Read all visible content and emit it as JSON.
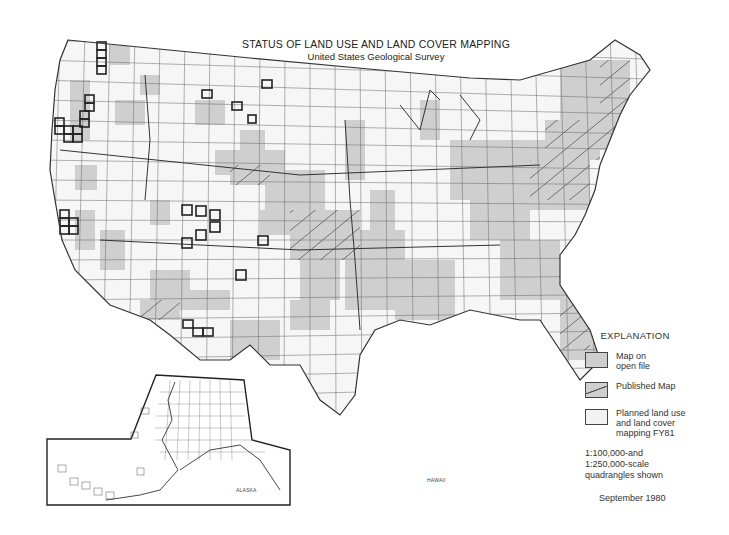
{
  "header": {
    "title": "STATUS OF LAND USE AND LAND COVER MAPPING",
    "subtitle": "United States Geological Survey"
  },
  "legend": {
    "heading": "EXPLANATION",
    "items": [
      {
        "key": "open",
        "label": "Map on\nopen file",
        "color": "#cfcfcf"
      },
      {
        "key": "published",
        "label": "Published Map",
        "color": "#cfcfcf",
        "pattern": "diagonal-hatch"
      },
      {
        "key": "planned",
        "label": "Planned land use\nand land cover\nmapping FY81",
        "color": "#f2f2f2",
        "border": "bold"
      }
    ],
    "scale_note": "1:100,000-and\n1:250,000-scale\nquadrangles shown",
    "date": "September 1980"
  },
  "insets": {
    "alaska": {
      "label": "ALASKA"
    },
    "hawaii": {
      "label": "HAWAII"
    }
  },
  "colors": {
    "open_file": "#cfcfcf",
    "planned": "#f2f2f2",
    "grid_line": "#555555",
    "boundary": "#333333"
  }
}
